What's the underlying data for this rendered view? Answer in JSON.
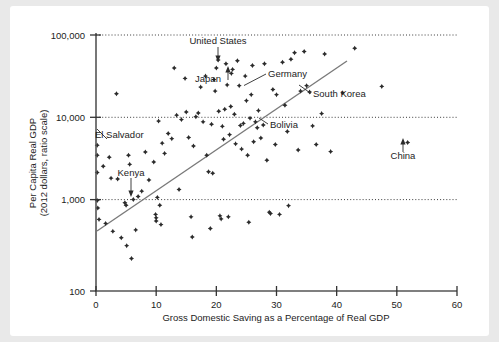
{
  "figure": {
    "background_color": "#ffffff",
    "page_color": "#e9e9e9"
  },
  "chart_data": {
    "type": "scatter",
    "title": "",
    "xlabel": "Gross Domestic Saving as a Percentage of Real GDP",
    "ylabel_line1": "Per Capita Real GDP",
    "ylabel_line2": "(2012 dollars, ratio scale)",
    "xlim": [
      -1.5,
      63
    ],
    "ylim_log": [
      100,
      100000
    ],
    "yscale": "log",
    "grid": "horizontal dotted at 100,000 / 10,000 / 1,000",
    "legend": "none",
    "xticks": [
      0,
      10,
      20,
      30,
      40,
      50,
      60
    ],
    "xtick_labels": [
      "0",
      "10",
      "20",
      "30",
      "40",
      "50",
      "60"
    ],
    "yticks": [
      100,
      1000,
      10000,
      100000
    ],
    "ytick_labels": [
      "100",
      "1,000",
      "10,000",
      "100,000"
    ],
    "trend_line": {
      "label": "fitted trend line",
      "x_start": 0.2,
      "y_start": 560,
      "x_end": 42.5,
      "y_end": 34000
    },
    "annotations": [
      {
        "text": "United States",
        "x": 17.5,
        "y": 62000,
        "point_x": 20.3,
        "point_y": 51000
      },
      {
        "text": "Japan",
        "x": 17.5,
        "y": 28000,
        "point_x": 22.5,
        "point_y": 35500
      },
      {
        "text": "Germany",
        "x": 25.5,
        "y": 29000,
        "point_x": 22.7,
        "point_y": 39500
      },
      {
        "text": "South Korea",
        "x": 33.5,
        "y": 15500,
        "point_x": 30.0,
        "point_y": 20000
      },
      {
        "text": "Bolivia",
        "x": 27.0,
        "y": 8000,
        "point_x": 24.5,
        "point_y": 9200
      },
      {
        "text": "El Salvador",
        "x": 0.8,
        "y": 8200,
        "point_x": 0.3,
        "point_y": 5100
      },
      {
        "text": "Kenya",
        "x": 4.0,
        "y": 2000,
        "point_x": 5.2,
        "point_y": 1020
      },
      {
        "text": "China",
        "x": 50.5,
        "y": 2350,
        "point_x": 51.8,
        "point_y": 5500
      }
    ],
    "points": [
      {
        "x": 0.2,
        "y": 5100
      },
      {
        "x": 0.2,
        "y": 3900
      },
      {
        "x": 0.2,
        "y": 2450
      },
      {
        "x": 0.2,
        "y": 1150
      },
      {
        "x": 0.3,
        "y": 940
      },
      {
        "x": 0.5,
        "y": 690
      },
      {
        "x": 1.2,
        "y": 2900
      },
      {
        "x": 1.6,
        "y": 620
      },
      {
        "x": 2.2,
        "y": 3700
      },
      {
        "x": 2.5,
        "y": 2100
      },
      {
        "x": 2.8,
        "y": 500
      },
      {
        "x": 3.4,
        "y": 20500
      },
      {
        "x": 3.6,
        "y": 2050
      },
      {
        "x": 4.2,
        "y": 420
      },
      {
        "x": 4.8,
        "y": 1080
      },
      {
        "x": 5.0,
        "y": 1010
      },
      {
        "x": 5.1,
        "y": 340
      },
      {
        "x": 5.4,
        "y": 3900
      },
      {
        "x": 5.6,
        "y": 3050
      },
      {
        "x": 5.9,
        "y": 240
      },
      {
        "x": 6.2,
        "y": 1180
      },
      {
        "x": 6.6,
        "y": 520
      },
      {
        "x": 7.0,
        "y": 1280
      },
      {
        "x": 7.6,
        "y": 1480
      },
      {
        "x": 8.2,
        "y": 4250
      },
      {
        "x": 8.8,
        "y": 2000
      },
      {
        "x": 9.6,
        "y": 3250
      },
      {
        "x": 9.9,
        "y": 790
      },
      {
        "x": 10.0,
        "y": 720
      },
      {
        "x": 10.0,
        "y": 660
      },
      {
        "x": 10.2,
        "y": 1250
      },
      {
        "x": 10.4,
        "y": 9800
      },
      {
        "x": 10.6,
        "y": 1010
      },
      {
        "x": 10.8,
        "y": 600
      },
      {
        "x": 11.0,
        "y": 5400
      },
      {
        "x": 11.4,
        "y": 4100
      },
      {
        "x": 12.0,
        "y": 7000
      },
      {
        "x": 12.6,
        "y": 6100
      },
      {
        "x": 13.0,
        "y": 41000
      },
      {
        "x": 13.4,
        "y": 11500
      },
      {
        "x": 13.8,
        "y": 1550
      },
      {
        "x": 14.2,
        "y": 10200
      },
      {
        "x": 14.8,
        "y": 31000
      },
      {
        "x": 15.0,
        "y": 12500
      },
      {
        "x": 15.4,
        "y": 6300
      },
      {
        "x": 15.8,
        "y": 740
      },
      {
        "x": 16.0,
        "y": 430
      },
      {
        "x": 16.2,
        "y": 5000
      },
      {
        "x": 16.6,
        "y": 11000
      },
      {
        "x": 17.0,
        "y": 12200
      },
      {
        "x": 17.4,
        "y": 24500
      },
      {
        "x": 17.8,
        "y": 9600
      },
      {
        "x": 18.2,
        "y": 33000
      },
      {
        "x": 18.4,
        "y": 3900
      },
      {
        "x": 18.7,
        "y": 2500
      },
      {
        "x": 19.0,
        "y": 540
      },
      {
        "x": 19.2,
        "y": 9000
      },
      {
        "x": 19.4,
        "y": 2400
      },
      {
        "x": 19.6,
        "y": 30000
      },
      {
        "x": 19.8,
        "y": 22000
      },
      {
        "x": 20.0,
        "y": 41000
      },
      {
        "x": 20.3,
        "y": 51000
      },
      {
        "x": 20.4,
        "y": 12800
      },
      {
        "x": 20.6,
        "y": 760
      },
      {
        "x": 20.8,
        "y": 700
      },
      {
        "x": 21.0,
        "y": 8500
      },
      {
        "x": 21.2,
        "y": 6000
      },
      {
        "x": 21.4,
        "y": 13500
      },
      {
        "x": 21.6,
        "y": 46000
      },
      {
        "x": 21.8,
        "y": 26000
      },
      {
        "x": 22.0,
        "y": 740
      },
      {
        "x": 22.2,
        "y": 6800
      },
      {
        "x": 22.4,
        "y": 14500
      },
      {
        "x": 22.5,
        "y": 35500
      },
      {
        "x": 22.7,
        "y": 39500
      },
      {
        "x": 23.0,
        "y": 11800
      },
      {
        "x": 23.2,
        "y": 5300
      },
      {
        "x": 23.5,
        "y": 50000
      },
      {
        "x": 23.8,
        "y": 25500
      },
      {
        "x": 24.0,
        "y": 8700
      },
      {
        "x": 24.2,
        "y": 4600
      },
      {
        "x": 24.5,
        "y": 9200
      },
      {
        "x": 24.8,
        "y": 33000
      },
      {
        "x": 25.0,
        "y": 17000
      },
      {
        "x": 25.2,
        "y": 3900
      },
      {
        "x": 25.4,
        "y": 640
      },
      {
        "x": 25.6,
        "y": 10600
      },
      {
        "x": 25.8,
        "y": 20000
      },
      {
        "x": 26.0,
        "y": 44000
      },
      {
        "x": 26.2,
        "y": 5600
      },
      {
        "x": 26.5,
        "y": 9600
      },
      {
        "x": 26.8,
        "y": 8200
      },
      {
        "x": 27.0,
        "y": 13000
      },
      {
        "x": 27.4,
        "y": 6200
      },
      {
        "x": 27.8,
        "y": 8800
      },
      {
        "x": 28.0,
        "y": 46000
      },
      {
        "x": 28.4,
        "y": 3400
      },
      {
        "x": 28.8,
        "y": 840
      },
      {
        "x": 29.0,
        "y": 810
      },
      {
        "x": 29.4,
        "y": 23000
      },
      {
        "x": 29.8,
        "y": 5200
      },
      {
        "x": 30.0,
        "y": 20000
      },
      {
        "x": 30.5,
        "y": 790
      },
      {
        "x": 31.0,
        "y": 48000
      },
      {
        "x": 31.4,
        "y": 15000
      },
      {
        "x": 31.8,
        "y": 7400
      },
      {
        "x": 32.0,
        "y": 1000
      },
      {
        "x": 32.4,
        "y": 52000
      },
      {
        "x": 33.0,
        "y": 62000
      },
      {
        "x": 33.6,
        "y": 4500
      },
      {
        "x": 34.0,
        "y": 22000
      },
      {
        "x": 34.6,
        "y": 64000
      },
      {
        "x": 35.0,
        "y": 25500
      },
      {
        "x": 35.5,
        "y": 21500
      },
      {
        "x": 36.0,
        "y": 8600
      },
      {
        "x": 36.6,
        "y": 5200
      },
      {
        "x": 37.5,
        "y": 12000
      },
      {
        "x": 38.0,
        "y": 60000
      },
      {
        "x": 39.0,
        "y": 4300
      },
      {
        "x": 41.0,
        "y": 21000
      },
      {
        "x": 43.0,
        "y": 70000
      },
      {
        "x": 47.5,
        "y": 25000
      },
      {
        "x": 51.8,
        "y": 5500
      }
    ]
  },
  "axis": {
    "x_title": "Gross Domestic Saving as a Percentage of Real GDP",
    "y_title_line1": "Per Capita Real GDP",
    "y_title_line2": "(2012 dollars, ratio scale)",
    "x_tick_labels": [
      "0",
      "10",
      "20",
      "30",
      "40",
      "50",
      "60"
    ],
    "y_tick_labels": [
      "100,000",
      "10,000",
      "1,000",
      "100"
    ]
  },
  "labels": {
    "united_states": "United States",
    "japan": "Japan",
    "germany": "Germany",
    "south_korea": "South Korea",
    "bolivia": "Bolivia",
    "el_salvador": "El Salvador",
    "kenya": "Kenya",
    "china": "China"
  },
  "colors": {
    "point": "#2b2b2b",
    "trend": "#7a7a7a",
    "axis": "#555555",
    "grid": "#3a3a3a",
    "text": "#1c1c1c"
  }
}
